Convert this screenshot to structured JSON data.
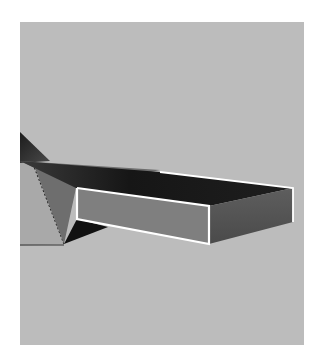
{
  "viewport": {
    "label": "3D viewport",
    "background": "#bcbcbc",
    "objects": [
      {
        "name": "fin",
        "color": "#2a2a2a"
      },
      {
        "name": "box-top-face",
        "color": "#1b1b1b"
      },
      {
        "name": "box-front-face",
        "color": "#7f7f7f",
        "selected": true
      },
      {
        "name": "box-side-face",
        "color": "#5a5a5a"
      },
      {
        "name": "left-face",
        "color": "#a8a8a8"
      }
    ],
    "selection_outline_color": "#ffffff"
  }
}
